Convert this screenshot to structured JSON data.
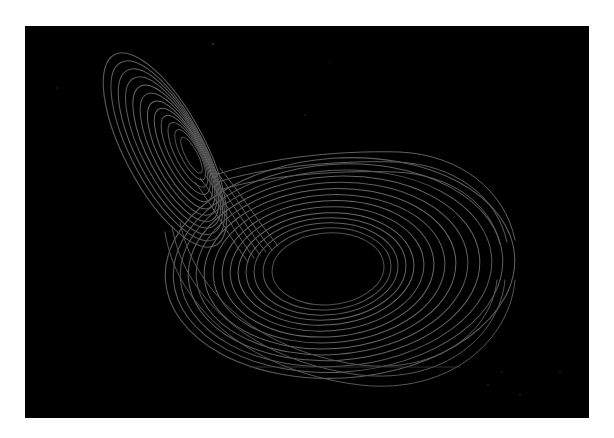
{
  "image": {
    "subject": "Lorenz attractor",
    "description": "Butterfly-shaped strange attractor trajectory rendered as thin gray lines on a black background",
    "colors": {
      "page_background": "#ffffff",
      "panel_background": "#000000",
      "trajectory_stroke": "#5e5e5e",
      "trajectory_stroke_bright": "#7a7a7a"
    },
    "lobes": [
      {
        "name": "upper-left-lobe",
        "center": [
          165,
          160
        ],
        "orientation": "tilted ellipse, long axis running from upper-left to lower-right"
      },
      {
        "name": "lower-right-lobe",
        "center": [
          340,
          270
        ],
        "orientation": "wide horizontal ellipse"
      }
    ]
  }
}
